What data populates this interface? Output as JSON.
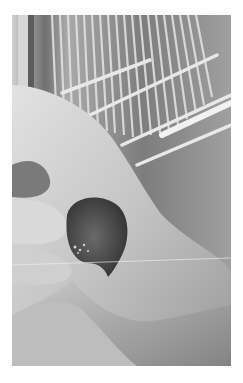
{
  "image": {
    "description": "Grayscale photo of a hand gently holding a small bird, wire cage bars in background",
    "style": "grayscale",
    "subject": "small bird held in a hand",
    "background": "wire cage bars and perches"
  },
  "colors": {
    "page_background": "#ffffff",
    "skin_light": "#d6d6d6",
    "skin_mid": "#b8b8b8",
    "skin_shadow": "#8a8a8a",
    "cage_dark": "#5a5a5a",
    "cage_bar": "#dcdcdc",
    "bird": "#4a4a4a"
  }
}
